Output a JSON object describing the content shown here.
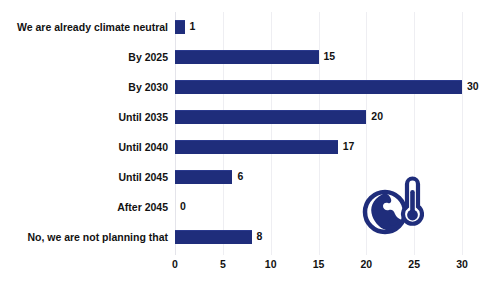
{
  "chart_data": {
    "type": "bar",
    "orientation": "horizontal",
    "title": "",
    "subtitle": "",
    "xlabel": "",
    "ylabel": "",
    "categories": [
      "We are already climate neutral",
      "By 2025",
      "By 2030",
      "Until 2035",
      "Until 2040",
      "Until 2045",
      "After 2045",
      "No, we are not planning that"
    ],
    "values": [
      1,
      15,
      30,
      20,
      17,
      6,
      0,
      8
    ],
    "value_labels": [
      "1",
      "15",
      "30",
      "20",
      "17",
      "6",
      "0",
      "8"
    ],
    "xlim": [
      0,
      30
    ],
    "xticks": [
      0,
      5,
      10,
      15,
      20,
      25,
      30
    ],
    "xtick_labels": [
      "0",
      "5",
      "10",
      "15",
      "20",
      "25",
      "30"
    ],
    "grid": true,
    "grid_axis": "x",
    "legend": false,
    "bar_color": "#1f2d7b",
    "background_color": "#ffffff",
    "text_color": "#121212",
    "gridline_color": "#eeeef2"
  },
  "decoration": {
    "icon_name": "globe-thermometer-icon",
    "icon_color": "#1f2d7b"
  }
}
